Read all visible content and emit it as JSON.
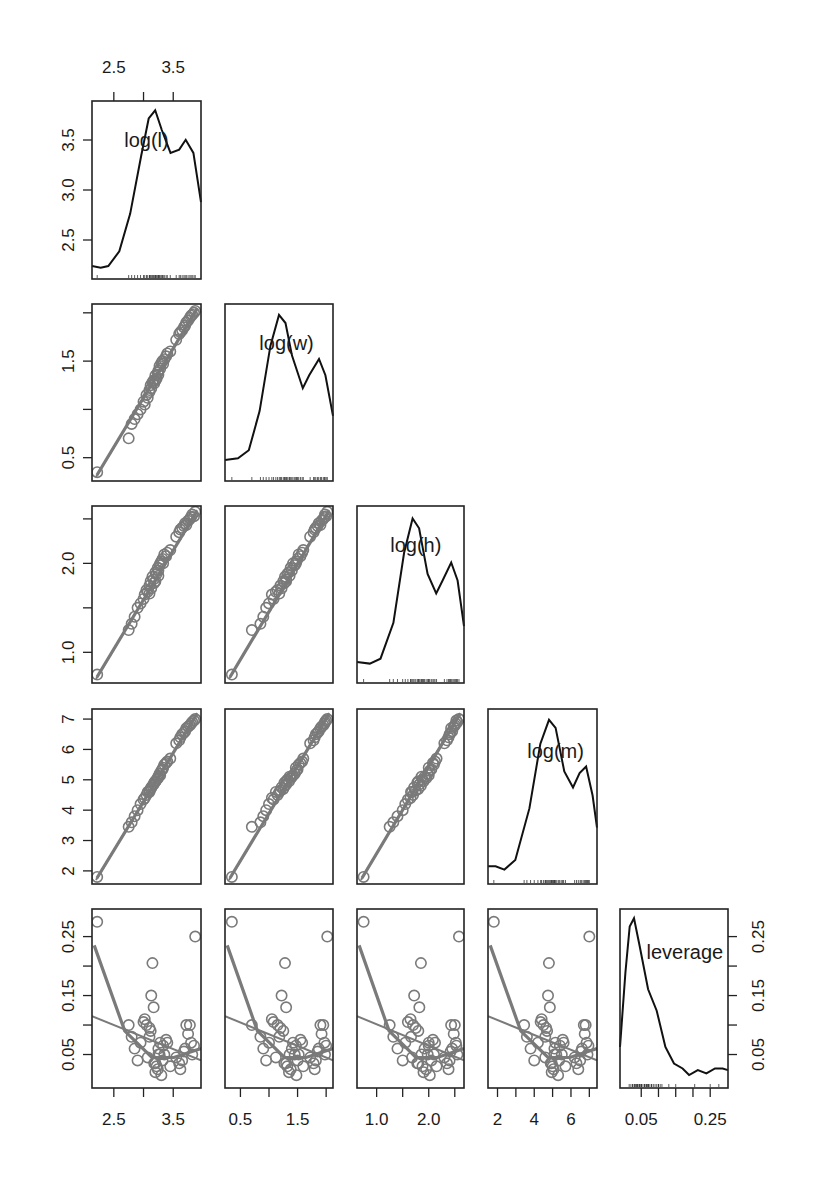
{
  "chart_data": {
    "type": "scatter",
    "title": "",
    "variables": [
      "log(l)",
      "log(w)",
      "log(h)",
      "log(m)",
      "leverage"
    ],
    "layout": {
      "columns": [
        [
          92,
          201
        ],
        [
          225,
          333
        ],
        [
          357,
          464
        ],
        [
          488,
          597
        ],
        [
          620,
          728
        ]
      ],
      "rows": [
        [
          101,
          279
        ],
        [
          304,
          481
        ],
        [
          506,
          683
        ],
        [
          709,
          884
        ],
        [
          909,
          1088
        ]
      ]
    },
    "axes": [
      {
        "name": "log(l)",
        "range": [
          2.2,
          3.9
        ],
        "ticks": [
          2.5,
          3.0,
          3.5
        ],
        "labels": [
          "2.5",
          "3.5"
        ],
        "label_ticks": [
          2.5,
          3.5
        ]
      },
      {
        "name": "log(w)",
        "range": [
          0.3,
          2.05
        ],
        "ticks": [
          0.5,
          1.0,
          1.5,
          2.0
        ],
        "labels": [
          "0.5",
          "1.5"
        ],
        "label_ticks": [
          0.5,
          1.5
        ]
      },
      {
        "name": "log(h)",
        "range": [
          0.7,
          2.6
        ],
        "ticks": [
          1.0,
          1.5,
          2.0,
          2.5
        ],
        "labels": [
          "1.0",
          "2.0"
        ],
        "label_ticks": [
          1.0,
          2.0
        ]
      },
      {
        "name": "log(m)",
        "range": [
          1.7,
          7.2
        ],
        "ticks": [
          2,
          3,
          4,
          5,
          6,
          7
        ],
        "labels": [
          "2",
          "4",
          "6"
        ],
        "label_ticks": [
          2,
          4,
          6
        ]
      },
      {
        "name": "leverage",
        "range": [
          0.0,
          0.29
        ],
        "ticks": [
          0.05,
          0.1,
          0.15,
          0.2,
          0.25
        ],
        "labels": [
          "0.05",
          "0.25"
        ],
        "label_ticks": [
          0.05,
          0.25
        ]
      }
    ],
    "left_axis_labels": [
      {
        "row": 0,
        "ticks": [
          2.5,
          3.0,
          3.5
        ],
        "labels": [
          "2.5",
          "3.0",
          "3.5"
        ],
        "range": [
          2.15,
          3.85
        ]
      },
      {
        "row": 1,
        "ticks": [
          0.5,
          1.0,
          1.5,
          2.0
        ],
        "labels": [
          "0.5",
          "1.5"
        ],
        "label_ticks": [
          0.5,
          1.5
        ],
        "range": [
          0.3,
          2.05
        ]
      },
      {
        "row": 2,
        "ticks": [
          1.0,
          1.5,
          2.0,
          2.5
        ],
        "labels": [
          "1.0",
          "2.0"
        ],
        "label_ticks": [
          1.0,
          2.0
        ],
        "range": [
          0.7,
          2.6
        ]
      },
      {
        "row": 3,
        "ticks": [
          2,
          3,
          4,
          5,
          6,
          7
        ],
        "labels": [
          "2",
          "3",
          "4",
          "5",
          "6",
          "7"
        ],
        "range": [
          1.7,
          7.2
        ]
      },
      {
        "row": 4,
        "ticks": [
          0.05,
          0.1,
          0.15,
          0.2,
          0.25
        ],
        "labels": [
          "0.05",
          "0.15",
          "0.25"
        ],
        "label_ticks": [
          0.05,
          0.15,
          0.25
        ],
        "range": [
          0.0,
          0.29
        ]
      }
    ],
    "top_axis": {
      "column": 0,
      "ticks": [
        2.5,
        3.0,
        3.5
      ],
      "labels": [
        "2.5",
        "3.5"
      ],
      "label_ticks": [
        2.5,
        3.5
      ]
    },
    "right_axis": {
      "row": 4,
      "ticks": [
        0.05,
        0.1,
        0.15,
        0.2,
        0.25
      ],
      "labels": [
        "0.05",
        "0.15",
        "0.25"
      ],
      "label_ticks": [
        0.05,
        0.15,
        0.25
      ]
    },
    "density_curves": {
      "log(l)": [
        [
          0.0,
          0.03
        ],
        [
          0.08,
          0.02
        ],
        [
          0.15,
          0.03
        ],
        [
          0.25,
          0.12
        ],
        [
          0.35,
          0.35
        ],
        [
          0.45,
          0.7
        ],
        [
          0.52,
          0.93
        ],
        [
          0.58,
          0.98
        ],
        [
          0.64,
          0.86
        ],
        [
          0.72,
          0.72
        ],
        [
          0.8,
          0.74
        ],
        [
          0.86,
          0.8
        ],
        [
          0.93,
          0.72
        ],
        [
          1.0,
          0.42
        ]
      ],
      "log(w)": [
        [
          0.0,
          0.08
        ],
        [
          0.12,
          0.09
        ],
        [
          0.22,
          0.14
        ],
        [
          0.32,
          0.38
        ],
        [
          0.42,
          0.78
        ],
        [
          0.5,
          0.97
        ],
        [
          0.56,
          0.92
        ],
        [
          0.62,
          0.72
        ],
        [
          0.72,
          0.52
        ],
        [
          0.78,
          0.6
        ],
        [
          0.87,
          0.7
        ],
        [
          0.93,
          0.6
        ],
        [
          1.0,
          0.35
        ]
      ],
      "log(h)": [
        [
          0.0,
          0.08
        ],
        [
          0.12,
          0.07
        ],
        [
          0.22,
          0.1
        ],
        [
          0.34,
          0.32
        ],
        [
          0.44,
          0.75
        ],
        [
          0.52,
          0.96
        ],
        [
          0.58,
          0.9
        ],
        [
          0.66,
          0.62
        ],
        [
          0.74,
          0.5
        ],
        [
          0.8,
          0.58
        ],
        [
          0.88,
          0.69
        ],
        [
          0.94,
          0.58
        ],
        [
          1.0,
          0.3
        ]
      ],
      "log(m)": [
        [
          0.0,
          0.06
        ],
        [
          0.07,
          0.06
        ],
        [
          0.15,
          0.04
        ],
        [
          0.25,
          0.1
        ],
        [
          0.38,
          0.42
        ],
        [
          0.48,
          0.82
        ],
        [
          0.56,
          0.97
        ],
        [
          0.62,
          0.92
        ],
        [
          0.7,
          0.65
        ],
        [
          0.78,
          0.55
        ],
        [
          0.84,
          0.64
        ],
        [
          0.9,
          0.68
        ],
        [
          0.96,
          0.5
        ],
        [
          1.0,
          0.3
        ]
      ],
      "leverage": [
        [
          0.0,
          0.2
        ],
        [
          0.05,
          0.65
        ],
        [
          0.09,
          0.93
        ],
        [
          0.13,
          0.98
        ],
        [
          0.18,
          0.82
        ],
        [
          0.26,
          0.55
        ],
        [
          0.34,
          0.42
        ],
        [
          0.42,
          0.2
        ],
        [
          0.5,
          0.1
        ],
        [
          0.58,
          0.07
        ],
        [
          0.64,
          0.03
        ],
        [
          0.72,
          0.06
        ],
        [
          0.8,
          0.04
        ],
        [
          0.88,
          0.07
        ],
        [
          0.95,
          0.07
        ],
        [
          1.0,
          0.06
        ]
      ]
    },
    "points": {
      "log(l)": [
        2.22,
        2.75,
        2.8,
        2.85,
        2.9,
        2.95,
        3.0,
        3.02,
        3.05,
        3.07,
        3.1,
        3.12,
        3.13,
        3.15,
        3.17,
        3.18,
        3.2,
        3.22,
        3.24,
        3.25,
        3.27,
        3.28,
        3.3,
        3.32,
        3.33,
        3.35,
        3.38,
        3.4,
        3.45,
        3.55,
        3.6,
        3.62,
        3.65,
        3.68,
        3.7,
        3.72,
        3.75,
        3.78,
        3.8,
        3.82,
        3.85,
        3.87,
        3.1,
        3.2,
        3.25
      ],
      "log(w)": [
        0.35,
        0.7,
        0.85,
        0.9,
        0.95,
        1.0,
        1.08,
        1.05,
        1.15,
        1.12,
        1.2,
        1.25,
        1.22,
        1.28,
        1.3,
        1.27,
        1.35,
        1.32,
        1.38,
        1.4,
        1.45,
        1.42,
        1.48,
        1.5,
        1.47,
        1.52,
        1.55,
        1.58,
        1.6,
        1.72,
        1.78,
        1.8,
        1.82,
        1.85,
        1.87,
        1.9,
        1.92,
        1.95,
        1.97,
        1.98,
        2.0,
        2.02,
        1.18,
        1.3,
        1.36
      ],
      "log(h)": [
        0.75,
        1.25,
        1.32,
        1.4,
        1.5,
        1.55,
        1.6,
        1.65,
        1.7,
        1.68,
        1.75,
        1.8,
        1.72,
        1.85,
        1.82,
        1.78,
        1.9,
        1.88,
        1.95,
        1.92,
        1.98,
        2.0,
        2.02,
        2.05,
        2.0,
        2.1,
        2.08,
        2.12,
        2.15,
        2.3,
        2.35,
        2.38,
        2.4,
        2.42,
        2.45,
        2.43,
        2.48,
        2.5,
        2.52,
        2.55,
        2.53,
        2.58,
        1.66,
        1.8,
        1.86
      ],
      "log(m)": [
        1.8,
        3.45,
        3.6,
        3.8,
        4.0,
        4.2,
        4.35,
        4.4,
        4.5,
        4.6,
        4.65,
        4.7,
        4.75,
        4.8,
        4.85,
        4.9,
        4.95,
        5.0,
        5.05,
        5.1,
        5.2,
        5.15,
        5.3,
        5.35,
        5.4,
        5.5,
        5.55,
        5.6,
        5.7,
        6.2,
        6.3,
        6.4,
        6.5,
        6.55,
        6.6,
        6.7,
        6.75,
        6.8,
        6.85,
        6.9,
        6.95,
        7.0,
        4.6,
        4.95,
        5.1
      ],
      "leverage": [
        0.275,
        0.1,
        0.08,
        0.06,
        0.04,
        0.07,
        0.105,
        0.11,
        0.1,
        0.045,
        0.095,
        0.09,
        0.15,
        0.205,
        0.13,
        0.035,
        0.02,
        0.03,
        0.025,
        0.06,
        0.05,
        0.07,
        0.015,
        0.04,
        0.065,
        0.05,
        0.075,
        0.07,
        0.03,
        0.045,
        0.035,
        0.025,
        0.04,
        0.055,
        0.06,
        0.1,
        0.085,
        0.1,
        0.07,
        0.05,
        0.065,
        0.25,
        0.08,
        0.035,
        0.05
      ]
    },
    "leverage_smooth": [
      [
        0.02,
        0.235
      ],
      [
        0.3,
        0.09
      ],
      [
        0.55,
        0.045
      ],
      [
        0.75,
        0.045
      ],
      [
        1.0,
        0.06
      ]
    ],
    "leverage_linear": [
      [
        0.0,
        0.115
      ],
      [
        1.0,
        0.04
      ]
    ],
    "diagonal_label_positions": [
      [
        0.5,
        0.18
      ],
      [
        0.57,
        0.18
      ],
      [
        0.55,
        0.18
      ],
      [
        0.62,
        0.2
      ],
      [
        0.6,
        0.2
      ]
    ],
    "colors": {
      "frame": "#222222",
      "points": "#7a7a7a",
      "density": "#111111",
      "background": "#ffffff"
    }
  }
}
